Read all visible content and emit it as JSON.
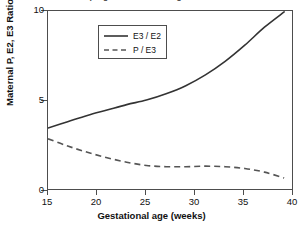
{
  "chart_data": {
    "type": "line",
    "title": "pregnancies surviving at term",
    "title_clipped": true,
    "xlabel": "Gestational age (weeks)",
    "ylabel": "Maternal P, E2, E3 Ratio",
    "xlim": [
      15,
      40
    ],
    "ylim": [
      0,
      10
    ],
    "xticks": [
      15,
      20,
      25,
      30,
      35,
      40
    ],
    "yticks": [
      0,
      5,
      10
    ],
    "grid": false,
    "legend_position": "top-left-inside",
    "series": [
      {
        "name": "E3 / E2",
        "style": "solid",
        "color": "#333333",
        "x": [
          15,
          17,
          19,
          21,
          23,
          25,
          27,
          29,
          31,
          33,
          35,
          37,
          39
        ],
        "values": [
          3.5,
          3.85,
          4.2,
          4.5,
          4.8,
          5.05,
          5.4,
          5.85,
          6.45,
          7.2,
          8.1,
          9.1,
          9.95
        ]
      },
      {
        "name": "P / E3",
        "style": "dashed",
        "color": "#555555",
        "x": [
          15,
          17,
          19,
          21,
          23,
          25,
          27,
          29,
          31,
          33,
          35,
          37,
          39
        ],
        "values": [
          2.9,
          2.5,
          2.15,
          1.85,
          1.6,
          1.42,
          1.35,
          1.35,
          1.38,
          1.35,
          1.25,
          1.05,
          0.72
        ]
      }
    ]
  },
  "axes": {
    "y_tick_labels": [
      "10",
      "5",
      "0"
    ],
    "x_tick_labels": [
      "15",
      "20",
      "25",
      "30",
      "35",
      "40"
    ]
  },
  "legend": {
    "entries": [
      {
        "label": "E3 / E2",
        "style": "solid"
      },
      {
        "label": "P / E3",
        "style": "dashed"
      }
    ]
  },
  "colors": {
    "background": "#ffffff",
    "axis": "#4d4d4d",
    "text": "#111111",
    "series_solid": "#333333",
    "series_dashed": "#555555"
  }
}
